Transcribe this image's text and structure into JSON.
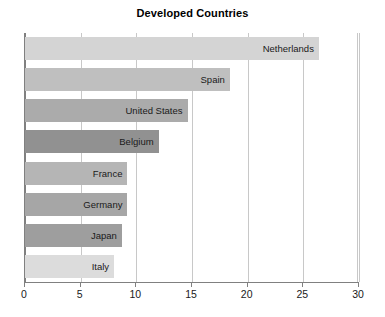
{
  "chart_data": {
    "type": "bar",
    "orientation": "horizontal",
    "title": "Developed Countries",
    "xlabel": "",
    "ylabel": "",
    "xlim": [
      0,
      30
    ],
    "xticks": [
      0,
      5,
      10,
      15,
      20,
      25,
      30
    ],
    "xtick_labels": [
      "0",
      "5",
      "10",
      "15",
      "20",
      "25",
      "30"
    ],
    "grid": true,
    "grid_axis": "x",
    "legend": false,
    "categories": [
      "Netherlands",
      "Spain",
      "United States",
      "Belgium",
      "France",
      "Germany",
      "Japan",
      "Italy"
    ],
    "values": [
      26.4,
      18.4,
      14.6,
      12.0,
      9.2,
      9.2,
      8.7,
      8.0
    ],
    "bars": [
      {
        "label": "Netherlands",
        "value": 26.4,
        "color": "#d4d4d4"
      },
      {
        "label": "Spain",
        "value": 18.4,
        "color": "#bfbfbf"
      },
      {
        "label": "United States",
        "value": 14.6,
        "color": "#ababab"
      },
      {
        "label": "Belgium",
        "value": 12.0,
        "color": "#919191"
      },
      {
        "label": "France",
        "value": 9.2,
        "color": "#b5b5b5"
      },
      {
        "label": "Germany",
        "value": 9.2,
        "color": "#a6a6a6"
      },
      {
        "label": "Japan",
        "value": 8.7,
        "color": "#9e9e9e"
      },
      {
        "label": "Italy",
        "value": 8.0,
        "color": "#dcdcdc"
      }
    ]
  },
  "axis": {
    "frame_color": "#808080",
    "grid_color": "#c8c8c8"
  }
}
